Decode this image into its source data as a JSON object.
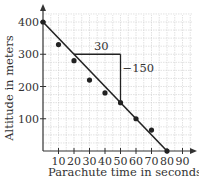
{
  "chart_data": {
    "type": "scatter",
    "title": "",
    "xlabel": "Parachute time in seconds",
    "ylabel": "Altitude in meters",
    "xlim": [
      0,
      90
    ],
    "ylim": [
      0,
      400
    ],
    "x_ticks": [
      "10",
      "20",
      "30",
      "40",
      "50",
      "60",
      "70",
      "80",
      "90"
    ],
    "y_ticks": [
      "100",
      "200",
      "300",
      "400"
    ],
    "grid": true,
    "series": [
      {
        "name": "observations",
        "type": "scatter",
        "x": [
          0,
          10,
          20,
          30,
          40,
          50,
          60,
          70,
          80
        ],
        "y": [
          400,
          330,
          280,
          220,
          180,
          150,
          100,
          65,
          0
        ]
      },
      {
        "name": "trend line",
        "type": "line",
        "x": [
          0,
          80
        ],
        "y": [
          400,
          0
        ]
      }
    ],
    "annotations": [
      {
        "text": "30",
        "meaning": "run (change in time)",
        "x_from": 20,
        "x_to": 50,
        "y": 300
      },
      {
        "text": "−150",
        "meaning": "rise (change in altitude)",
        "x": 50,
        "y_from": 300,
        "y_to": 150
      }
    ]
  },
  "labels": {
    "xlabel": "Parachute time in seconds",
    "ylabel": "Altitude in meters",
    "run": "30",
    "rise": "−150",
    "x_ticks": [
      "10",
      "20",
      "30",
      "40",
      "50",
      "60",
      "70",
      "80",
      "90"
    ],
    "y_ticks": [
      "100",
      "200",
      "300",
      "400"
    ]
  }
}
